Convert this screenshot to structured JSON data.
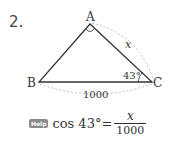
{
  "problem": {
    "number": "2."
  },
  "diagram": {
    "vertices": {
      "A": "A",
      "B": "B",
      "C": "C"
    },
    "angle_C": "43°",
    "side_AC": "x",
    "side_BC": "1000",
    "right_angle_at": "A",
    "colors": {
      "line": "#333333",
      "dashed": "#aaaaaa"
    }
  },
  "hint": {
    "badge": "Help",
    "lhs": "cos 43°",
    "equals": "=",
    "numerator": "x",
    "denominator": "1000"
  }
}
